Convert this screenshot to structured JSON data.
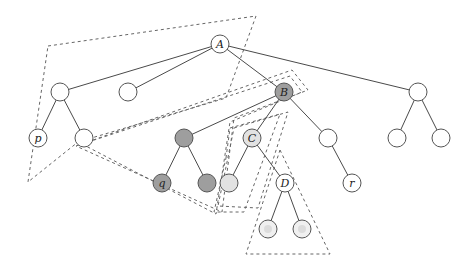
{
  "diagram": {
    "type": "tree-with-dashed-regions",
    "colors": {
      "white": "#ffffff",
      "dark_gray": "#9e9e9e",
      "light_gray": "#e2e2e2",
      "faded": "#f0f0f0",
      "edge": "#4a4a4a",
      "dashed": "#666666"
    },
    "nodes": [
      {
        "id": "A",
        "label": "A",
        "x": 220,
        "y": 44,
        "fill": "white"
      },
      {
        "id": "n1",
        "label": "",
        "x": 60,
        "y": 92,
        "fill": "white"
      },
      {
        "id": "n2",
        "label": "",
        "x": 128,
        "y": 92,
        "fill": "white"
      },
      {
        "id": "B",
        "label": "B",
        "x": 284,
        "y": 92,
        "fill": "dark_gray"
      },
      {
        "id": "n4",
        "label": "",
        "x": 418,
        "y": 92,
        "fill": "white"
      },
      {
        "id": "p",
        "label": "p",
        "x": 38,
        "y": 138,
        "fill": "white"
      },
      {
        "id": "n6",
        "label": "",
        "x": 84,
        "y": 138,
        "fill": "white"
      },
      {
        "id": "n7",
        "label": "",
        "x": 184,
        "y": 138,
        "fill": "dark_gray"
      },
      {
        "id": "C",
        "label": "C",
        "x": 252,
        "y": 138,
        "fill": "light_gray"
      },
      {
        "id": "n9",
        "label": "",
        "x": 328,
        "y": 138,
        "fill": "white"
      },
      {
        "id": "n10",
        "label": "",
        "x": 397,
        "y": 138,
        "fill": "white"
      },
      {
        "id": "n11",
        "label": "",
        "x": 441,
        "y": 138,
        "fill": "white"
      },
      {
        "id": "q",
        "label": "q",
        "x": 162,
        "y": 183,
        "fill": "dark_gray"
      },
      {
        "id": "n13",
        "label": "",
        "x": 207,
        "y": 183,
        "fill": "dark_gray"
      },
      {
        "id": "n14",
        "label": "",
        "x": 229,
        "y": 183,
        "fill": "light_gray"
      },
      {
        "id": "D",
        "label": "D",
        "x": 285,
        "y": 183,
        "fill": "white"
      },
      {
        "id": "r",
        "label": "r",
        "x": 352,
        "y": 183,
        "fill": "white"
      },
      {
        "id": "n17",
        "label": "",
        "x": 268,
        "y": 229,
        "fill": "faded"
      },
      {
        "id": "n18",
        "label": "",
        "x": 302,
        "y": 229,
        "fill": "faded"
      }
    ],
    "edges": [
      [
        "A",
        "n1"
      ],
      [
        "A",
        "n2"
      ],
      [
        "A",
        "B"
      ],
      [
        "A",
        "n4"
      ],
      [
        "n1",
        "p"
      ],
      [
        "n1",
        "n6"
      ],
      [
        "B",
        "n7"
      ],
      [
        "B",
        "C"
      ],
      [
        "B",
        "n9"
      ],
      [
        "n4",
        "n10"
      ],
      [
        "n4",
        "n11"
      ],
      [
        "n7",
        "q"
      ],
      [
        "n7",
        "n13"
      ],
      [
        "C",
        "n14"
      ],
      [
        "C",
        "D"
      ],
      [
        "n9",
        "r"
      ],
      [
        "D",
        "n17"
      ],
      [
        "D",
        "n18"
      ]
    ],
    "regions": [
      {
        "name": "region-left-top",
        "points": "48,46 256,16 226,98 78,142 28,182"
      },
      {
        "name": "region-band-to-B",
        "points": "76,146 292,70 308,90 234,118 222,212"
      },
      {
        "name": "region-band-inner",
        "points": "82,144 290,76 302,92 230,122 216,214"
      },
      {
        "name": "region-C-left",
        "points": "226,158 230,128 280,114 244,212 214,212"
      },
      {
        "name": "region-C-right",
        "points": "234,128 288,112 258,208 218,206"
      },
      {
        "name": "region-D",
        "points": "280,150 330,254 246,254"
      }
    ]
  }
}
